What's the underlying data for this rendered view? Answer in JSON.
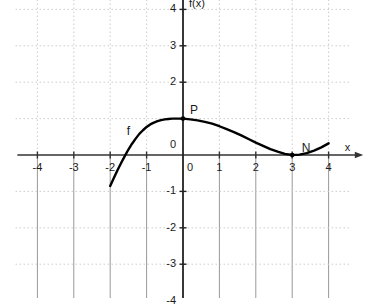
{
  "chart_data": {
    "type": "line",
    "title": "",
    "xlabel": "x",
    "ylabel": "f(x)",
    "xlim": [
      -4.6,
      4.6
    ],
    "ylim": [
      -4.6,
      4.6
    ],
    "grid": true,
    "legend_position": "none",
    "x_ticks": [
      -4,
      -3,
      -2,
      -1,
      0,
      1,
      2,
      3,
      4
    ],
    "x_tick_labels": [
      "-4",
      "-3",
      "-2",
      "-1",
      "0",
      "1",
      "2",
      "3",
      "4"
    ],
    "y_ticks": [
      -4,
      -3,
      -2,
      -1,
      0,
      1,
      2,
      3,
      4
    ],
    "y_tick_labels": [
      "-4",
      "-3",
      "-2",
      "-1",
      "0",
      "1",
      "2",
      "3",
      "4"
    ],
    "series": [
      {
        "name": "f",
        "color": "#000000",
        "domain": [
          -2.0,
          4.0
        ],
        "points": [
          [
            -2.0,
            -0.85
          ],
          [
            -1.9,
            -0.63
          ],
          [
            -1.8,
            -0.42
          ],
          [
            -1.7,
            -0.22
          ],
          [
            -1.6,
            -0.03
          ],
          [
            -1.5,
            0.15
          ],
          [
            -1.4,
            0.31
          ],
          [
            -1.3,
            0.45
          ],
          [
            -1.2,
            0.58
          ],
          [
            -1.1,
            0.68
          ],
          [
            -1.0,
            0.77
          ],
          [
            -0.9,
            0.84
          ],
          [
            -0.8,
            0.89
          ],
          [
            -0.7,
            0.93
          ],
          [
            -0.6,
            0.96
          ],
          [
            -0.5,
            0.98
          ],
          [
            -0.4,
            0.99
          ],
          [
            -0.3,
            1.0
          ],
          [
            -0.2,
            1.0
          ],
          [
            -0.1,
            1.0
          ],
          [
            0.0,
            1.0
          ],
          [
            0.2,
            0.98
          ],
          [
            0.4,
            0.95
          ],
          [
            0.6,
            0.91
          ],
          [
            0.8,
            0.86
          ],
          [
            1.0,
            0.79
          ],
          [
            1.2,
            0.71
          ],
          [
            1.4,
            0.63
          ],
          [
            1.6,
            0.54
          ],
          [
            1.8,
            0.44
          ],
          [
            2.0,
            0.34
          ],
          [
            2.2,
            0.25
          ],
          [
            2.4,
            0.16
          ],
          [
            2.6,
            0.09
          ],
          [
            2.8,
            0.03
          ],
          [
            3.0,
            0.0
          ],
          [
            3.2,
            0.01
          ],
          [
            3.4,
            0.05
          ],
          [
            3.6,
            0.12
          ],
          [
            3.8,
            0.21
          ],
          [
            4.0,
            0.32
          ]
        ]
      }
    ],
    "annotations": [
      {
        "name": "curve-label-f",
        "text": "f",
        "x": -1.5,
        "y": 0.62,
        "marker": false
      },
      {
        "name": "point-P",
        "text": "P",
        "x": 0.0,
        "y": 1.0,
        "marker": true,
        "label_dx": 11,
        "label_dy": -14
      },
      {
        "name": "point-N",
        "text": "N",
        "x": 3.0,
        "y": 0.0,
        "marker": true,
        "label_dx": 14,
        "label_dy": -12
      }
    ]
  },
  "axes": {
    "x_axis_label": "x",
    "y_axis_label": "f(x)",
    "origin_label": "0"
  },
  "colors": {
    "curve": "#000000",
    "axis": "#333333",
    "grid_upper": "#cccccc",
    "grid_lower": "#999999",
    "text": "#1a1a1a",
    "background": "#ffffff"
  }
}
